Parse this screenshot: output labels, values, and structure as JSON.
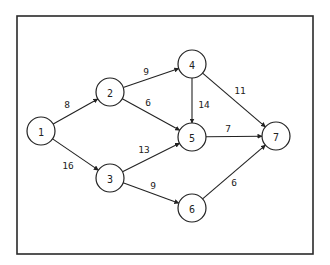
{
  "diagram": {
    "type": "directed-weighted-network",
    "frame": {
      "x": 17,
      "y": 16,
      "width": 296,
      "height": 238
    },
    "node_radius": 14,
    "nodes": [
      {
        "id": "1",
        "label": "1",
        "x": 41,
        "y": 131
      },
      {
        "id": "2",
        "label": "2",
        "x": 110,
        "y": 92
      },
      {
        "id": "3",
        "label": "3",
        "x": 110,
        "y": 178
      },
      {
        "id": "4",
        "label": "4",
        "x": 192,
        "y": 64
      },
      {
        "id": "5",
        "label": "5",
        "x": 192,
        "y": 137
      },
      {
        "id": "6",
        "label": "6",
        "x": 192,
        "y": 208
      },
      {
        "id": "7",
        "label": "7",
        "x": 276,
        "y": 136
      }
    ],
    "edges": [
      {
        "from": "1",
        "to": "2",
        "weight": "8",
        "label_x": 67,
        "label_y": 104
      },
      {
        "from": "1",
        "to": "3",
        "weight": "16",
        "label_x": 68,
        "label_y": 165
      },
      {
        "from": "2",
        "to": "4",
        "weight": "9",
        "label_x": 146,
        "label_y": 71
      },
      {
        "from": "2",
        "to": "5",
        "weight": "6",
        "label_x": 148,
        "label_y": 102
      },
      {
        "from": "3",
        "to": "5",
        "weight": "13",
        "label_x": 144,
        "label_y": 149
      },
      {
        "from": "3",
        "to": "6",
        "weight": "9",
        "label_x": 153,
        "label_y": 185
      },
      {
        "from": "4",
        "to": "5",
        "weight": "14",
        "label_x": 204,
        "label_y": 104
      },
      {
        "from": "4",
        "to": "7",
        "weight": "11",
        "label_x": 240,
        "label_y": 90
      },
      {
        "from": "5",
        "to": "7",
        "weight": "7",
        "label_x": 228,
        "label_y": 128
      },
      {
        "from": "6",
        "to": "7",
        "weight": "6",
        "label_x": 234,
        "label_y": 182
      }
    ]
  }
}
